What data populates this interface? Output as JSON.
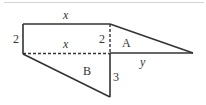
{
  "diagram": {
    "type": "geometry-composite-figure",
    "colors": {
      "stroke": "#333333",
      "separator": "#d4d4d4",
      "background": "#ffffff"
    },
    "shapes": {
      "rectangle": {
        "width_label": "x",
        "height_label": "2"
      },
      "triangle_A": {
        "label": "A",
        "height_label": "2",
        "base_label": "y"
      },
      "triangle_B": {
        "label": "B",
        "height_label": "3",
        "base_label": "x"
      }
    },
    "labels": {
      "top_width": "x",
      "left_height": "2",
      "mid_width": "x",
      "inner_height": "2",
      "region_a": "A",
      "region_b": "B",
      "right_base": "y",
      "lower_height": "3"
    }
  }
}
